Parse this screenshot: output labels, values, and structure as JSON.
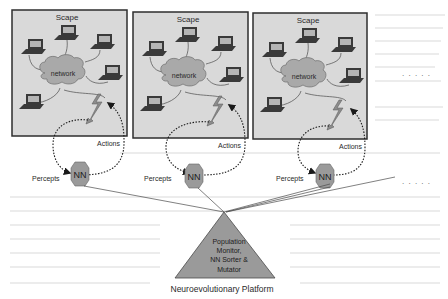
{
  "diagram": {
    "colors": {
      "background": "#ffffff",
      "scape_fill": "#d9d9d9",
      "scape_border": "#2e2e2e",
      "cloud_fill": "#a9a9a9",
      "cloud_stroke": "#6e6e6e",
      "laptop_body": "#3a3a3a",
      "laptop_screen": "#b5b5b5",
      "wire": "#4a4a4a",
      "bolt": "#8c8c8c",
      "nn_fill": "#9a9a9a",
      "triangle_fill": "#9a9a9a",
      "text": "#2a2a2a",
      "dots": "#555555"
    },
    "scapes": [
      {
        "title": "Scape",
        "cloud_label": "network",
        "actions_label": "Actions",
        "percepts_label": "Percepts",
        "nn_label": "NN"
      },
      {
        "title": "Scape",
        "cloud_label": "network",
        "actions_label": "Actions",
        "percepts_label": "Percepts",
        "nn_label": "NN"
      },
      {
        "title": "Scape",
        "cloud_label": "network",
        "actions_label": "Actions",
        "percepts_label": "Percepts",
        "nn_label": "NN"
      }
    ],
    "ellipsis_upper": ". . . . .",
    "ellipsis_lower": ". . . . .",
    "platform": {
      "lines": [
        "Population",
        "Monitor,",
        "NN Sorter &",
        "Mutator"
      ],
      "caption": "Neuroevolutionary Platform"
    }
  }
}
